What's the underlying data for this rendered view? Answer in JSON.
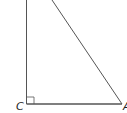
{
  "diagram": {
    "type": "right-triangle",
    "vertices": {
      "C": {
        "label": "C",
        "x": 26,
        "y": 104,
        "right_angle": true
      },
      "A": {
        "label": "A",
        "x": 122,
        "y": 104
      },
      "B": {
        "label": "",
        "x": 52,
        "y": 0
      }
    },
    "colors": {
      "stroke": "#555555",
      "label": "#222222",
      "background": "#ffffff"
    }
  }
}
